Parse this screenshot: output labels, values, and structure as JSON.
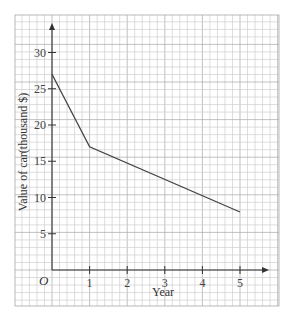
{
  "chart_data": {
    "type": "line",
    "title": "",
    "xlabel": "Year",
    "ylabel": "Value of car(thousand $)",
    "origin_label": "O",
    "x_ticks": [
      1,
      2,
      3,
      4,
      5
    ],
    "y_ticks": [
      5,
      10,
      15,
      20,
      25,
      30
    ],
    "xlim": [
      0,
      5
    ],
    "ylim": [
      0,
      30
    ],
    "grid": true,
    "series": [
      {
        "name": "Value of car",
        "x": [
          0,
          1,
          5
        ],
        "values": [
          27,
          17,
          8
        ]
      }
    ]
  },
  "colors": {
    "grid_minor": "#cfcfcf",
    "grid_major": "#a8a8a8",
    "axis": "#333333",
    "line": "#444444"
  }
}
